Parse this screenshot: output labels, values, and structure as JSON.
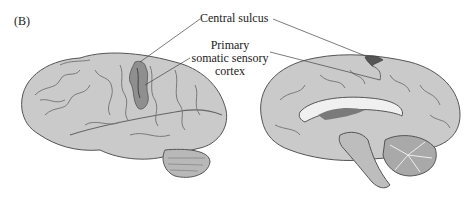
{
  "figure": {
    "panel_label": "(B)",
    "labels": {
      "central_sulcus": "Central sulcus",
      "primary_line1": "Primary",
      "primary_line2": "somatic sensory",
      "primary_line3": "cortex"
    },
    "views": [
      "lateral view of left hemisphere",
      "medial (midsagittal) view of right hemisphere"
    ],
    "colors": {
      "cortex": "#c9c9c9",
      "highlight": "#8f8f8f",
      "sulci": "#6d6d6d",
      "leader_lines": "#444444"
    }
  }
}
